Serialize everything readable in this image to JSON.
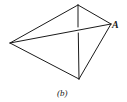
{
  "diagram": {
    "type": "tetrahedron-wireframe",
    "vertices": {
      "top": [
        78,
        5
      ],
      "left": [
        10,
        43
      ],
      "right": [
        111,
        24
      ],
      "bottom": [
        79,
        79
      ]
    },
    "vertex_label": "A",
    "caption": "(b)",
    "edges": [
      [
        "left",
        "top"
      ],
      [
        "top",
        "right"
      ],
      [
        "left",
        "right"
      ],
      [
        "left",
        "bottom"
      ],
      [
        "right",
        "bottom"
      ],
      [
        "top",
        "bottom"
      ]
    ],
    "line_color": "#1a1a1a"
  }
}
